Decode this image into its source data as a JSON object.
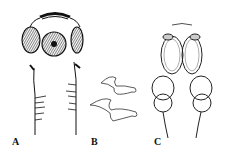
{
  "figure": {
    "panels": [
      {
        "id": "A",
        "label": "A",
        "description": "scolex with suckers and rostellar hooks"
      },
      {
        "id": "B",
        "label": "B",
        "description": "two rostellar hooks"
      },
      {
        "id": "C",
        "label": "C",
        "description": "pair of elongated bothridia/suckers"
      }
    ]
  },
  "colors": {
    "ink": "#111111",
    "background": "#ffffff"
  }
}
